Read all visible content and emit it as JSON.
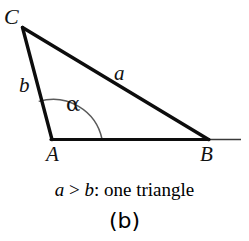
{
  "figure": {
    "background_color": "#ffffff",
    "stroke_color": "#0d0d0d",
    "thin_stroke_color": "#333333",
    "vertices": {
      "C": {
        "label": "C",
        "x": 22,
        "y": 27
      },
      "A": {
        "label": "A",
        "x": 52,
        "y": 139
      },
      "B": {
        "label": "B",
        "x": 208,
        "y": 139
      }
    },
    "sides": {
      "a": {
        "label": "a",
        "from": "C",
        "to": "B"
      },
      "b": {
        "label": "b",
        "from": "C",
        "to": "A"
      },
      "base": {
        "label": "",
        "from": "A",
        "to": "B"
      }
    },
    "ray": {
      "from_x": 208,
      "to_x": 241,
      "y": 139
    },
    "angle": {
      "label": "α",
      "at_vertex": "A",
      "radius": 50
    },
    "caption": {
      "part_a": "a",
      "relation": " > ",
      "part_b": "b",
      "tail": ": one triangle",
      "full": "a > b: one triangle"
    },
    "subfigure_label": "(b)"
  }
}
